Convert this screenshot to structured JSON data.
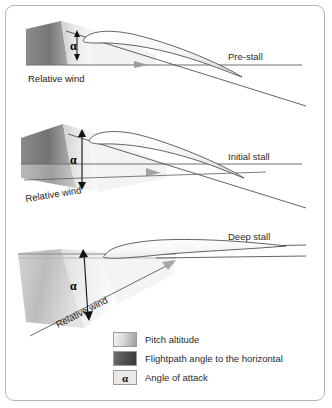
{
  "figure": {
    "background": "#ffffff",
    "border_color": "#b4b4b4"
  },
  "panels": [
    {
      "id": "pre-stall",
      "state_label": "Pre-stall",
      "relative_wind_label": "Relative wind",
      "alpha_label": "α",
      "wedge_description": "small wedge, dark flightpath band above horizontal",
      "relative_wind_angle_deg": 0
    },
    {
      "id": "initial-stall",
      "state_label": "Initial stall",
      "relative_wind_label": "Relative wind",
      "alpha_label": "α",
      "wedge_description": "medium wedge, dark flightpath band straddling horizontal",
      "relative_wind_angle_deg": 10
    },
    {
      "id": "deep-stall",
      "state_label": "Deep stall",
      "relative_wind_label": "Relative wind",
      "alpha_label": "α",
      "wedge_description": "large wedge, steep relative wind from lower left",
      "relative_wind_angle_deg": 33
    }
  ],
  "legend": {
    "items": [
      {
        "swatch": "pitch-attitude-swatch",
        "label": "Pitch altitude"
      },
      {
        "swatch": "flightpath-angle-swatch",
        "label": "Flightpath angle to the horizontal"
      },
      {
        "swatch": "angle-of-attack-swatch",
        "label": "Angle of attack",
        "symbol": "α"
      }
    ]
  },
  "colors": {
    "pitch_light": "#f4f4f4",
    "pitch_mid": "#d8d8d8",
    "pitch_dark": "#9d9d9d",
    "flightpath_light": "#6f6f6f",
    "flightpath_dark": "#3a3a3a",
    "line": "#6f6f6f",
    "text": "#2b2b2b"
  }
}
